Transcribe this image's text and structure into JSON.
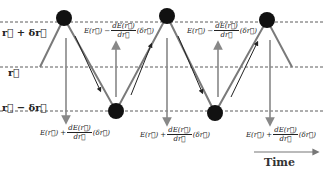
{
  "diagram": {
    "levels": {
      "upper": "r⃗ + δr⃗",
      "middle": "r⃗",
      "lower": "r⃗ − δr⃗"
    },
    "top_formulas": [
      {
        "lhs": "E(r⃗) −",
        "num": "dE(r⃗)",
        "den": "dr⃗",
        "rhs": "(δr⃗)"
      },
      {
        "lhs": "E(r⃗) −",
        "num": "dE(r⃗)",
        "den": "dr⃗",
        "rhs": "(δr⃗)"
      }
    ],
    "bottom_formulas": [
      {
        "lhs": "E(r⃗) +",
        "num": "dE(r⃗)",
        "den": "dr⃗",
        "rhs": "(δr⃗)"
      },
      {
        "lhs": "E(r⃗) +",
        "num": "dE(r⃗)",
        "den": "dr⃗",
        "rhs": "(δr⃗)"
      },
      {
        "lhs": "E(r⃗) +",
        "num": "dE(r⃗)",
        "den": "dr⃗",
        "rhs": "(δr⃗)"
      }
    ],
    "time_label": "Time",
    "colors": {
      "dot": "#111111",
      "zigzag": "#777777",
      "force_arrow": "#888888",
      "motion_arrow": "#222222",
      "dashed": "#333333"
    }
  }
}
